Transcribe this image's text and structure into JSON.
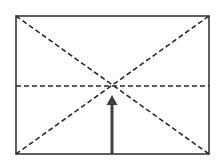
{
  "diagram": {
    "type": "frame-with-diagonals-and-arrow",
    "width": 221,
    "height": 162,
    "frame": {
      "x1": 16,
      "y1": 16,
      "x2": 209,
      "y2": 154,
      "color": "#3a3a3a",
      "stroke_width": 1.6
    },
    "dash_color": "#2a2a2a",
    "dash_pattern": "5 3",
    "dashed_lines": [
      {
        "name": "diagonal-tl-br",
        "x1": 16,
        "y1": 16,
        "x2": 209,
        "y2": 154
      },
      {
        "name": "diagonal-bl-tr",
        "x1": 16,
        "y1": 154,
        "x2": 209,
        "y2": 16
      },
      {
        "name": "horizontal-midline",
        "x1": 16,
        "y1": 86,
        "x2": 209,
        "y2": 86
      }
    ],
    "center_point": {
      "x": 113,
      "y": 86
    },
    "arrow": {
      "color": "#404040",
      "shaft_x": 112,
      "shaft_y_start": 154,
      "shaft_y_end": 104,
      "shaft_width": 3,
      "head_tip_y": 95,
      "head_base_y": 105,
      "head_half_width": 5.5,
      "direction": "up"
    }
  }
}
